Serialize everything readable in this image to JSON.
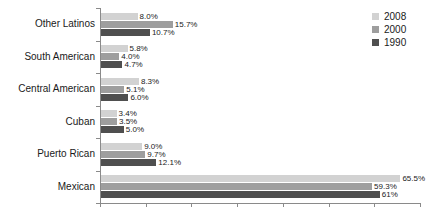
{
  "chart_data": {
    "type": "bar",
    "orientation": "horizontal",
    "title": "",
    "subtitle": "",
    "xlabel": "",
    "ylabel": "",
    "xlim": [
      0,
      70
    ],
    "grid": false,
    "xtick_labels": [],
    "xticks": [
      0,
      10,
      20,
      30,
      40,
      50,
      60,
      70
    ],
    "legend_position": "top-right",
    "categories": [
      "Other Latinos",
      "South American",
      "Central American",
      "Cuban",
      "Puerto Rican",
      "Mexican"
    ],
    "series": [
      {
        "name": "2008",
        "color": "#d2d2d2",
        "values": [
          8.0,
          5.8,
          8.3,
          3.4,
          9.0,
          65.5
        ],
        "labels": [
          "8.0%",
          "5.8%",
          "8.3%",
          "3.4%",
          "9.0%",
          "65.5%"
        ]
      },
      {
        "name": "2000",
        "color": "#9e9e9e",
        "values": [
          15.7,
          4.0,
          5.1,
          3.5,
          9.7,
          59.3
        ],
        "labels": [
          "15.7%",
          "4.0%",
          "5.1%",
          "3.5%",
          "9.7%",
          "59.3%"
        ]
      },
      {
        "name": "1990",
        "color": "#4f4f4f",
        "values": [
          10.7,
          4.7,
          6.0,
          5.0,
          12.1,
          61.0
        ],
        "labels": [
          "10.7%",
          "4.7%",
          "6.0%",
          "5.0%",
          "12.1%",
          "61%"
        ]
      }
    ]
  },
  "legend": {
    "entries": [
      {
        "label": "2008",
        "color": "#d2d2d2"
      },
      {
        "label": "2000",
        "color": "#9e9e9e"
      },
      {
        "label": "1990",
        "color": "#4f4f4f"
      }
    ]
  },
  "axis": {
    "line_color": "#8a8a8a"
  }
}
